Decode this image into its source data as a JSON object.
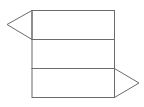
{
  "diagram": {
    "type": "triangular-prism-net",
    "stroke_color": "#6b6b6b",
    "background": "#ffffff",
    "rectangles": [
      {
        "name": "face-top",
        "x": 32,
        "y": 10.5,
        "w": 82.5,
        "h": 29
      },
      {
        "name": "face-middle",
        "x": 32,
        "y": 39.5,
        "w": 82.5,
        "h": 29
      },
      {
        "name": "face-bottom",
        "x": 32,
        "y": 68.5,
        "w": 82.5,
        "h": 29
      }
    ],
    "triangles": [
      {
        "name": "triangle-left",
        "points": "32,10.5 7,24.5 32,39.5"
      },
      {
        "name": "triangle-right",
        "points": "114.5,68.5 139,83 114.5,97.5"
      }
    ]
  }
}
